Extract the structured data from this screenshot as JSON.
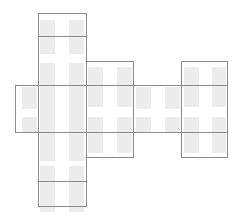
{
  "diagram": {
    "title": "",
    "colors": {
      "outline": "#8a8a8a",
      "block_fill": "#ececec",
      "background": "#ffffff"
    },
    "shapes": [
      {
        "name": "vertical-column-rect",
        "kind": "outline"
      },
      {
        "name": "horizontal-band-rect",
        "kind": "outline"
      },
      {
        "name": "middle-rect",
        "kind": "outline"
      },
      {
        "name": "right-rect",
        "kind": "outline"
      },
      {
        "name": "top-divider-line",
        "kind": "divider"
      },
      {
        "name": "bottom-divider-line",
        "kind": "divider"
      }
    ],
    "block_grid": {
      "rows": 6,
      "columns_per_rect": 2
    }
  }
}
